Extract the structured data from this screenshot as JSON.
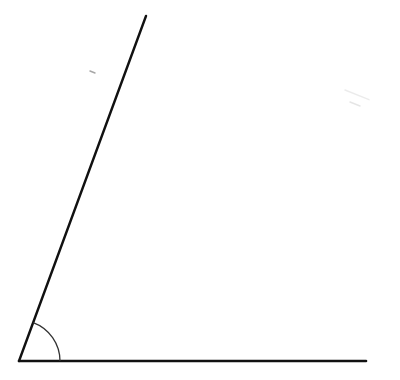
{
  "diagram": {
    "type": "angle",
    "background": "#ffffff",
    "stroke_color": "#111111",
    "arc_color": "#333333",
    "vertex": {
      "x": 19,
      "y": 361
    },
    "ray_base": {
      "end": {
        "x": 366,
        "y": 361
      }
    },
    "ray_slanted": {
      "end": {
        "x": 146,
        "y": 16
      }
    },
    "angle_arc": {
      "radius": 41
    },
    "marks": [
      {
        "x": 90,
        "y": 71,
        "len": 5,
        "opacity": 0.35
      },
      {
        "x": 345,
        "y": 90,
        "len": 24,
        "opacity": 0.08
      },
      {
        "x": 350,
        "y": 102,
        "len": 10,
        "opacity": 0.1
      }
    ]
  }
}
